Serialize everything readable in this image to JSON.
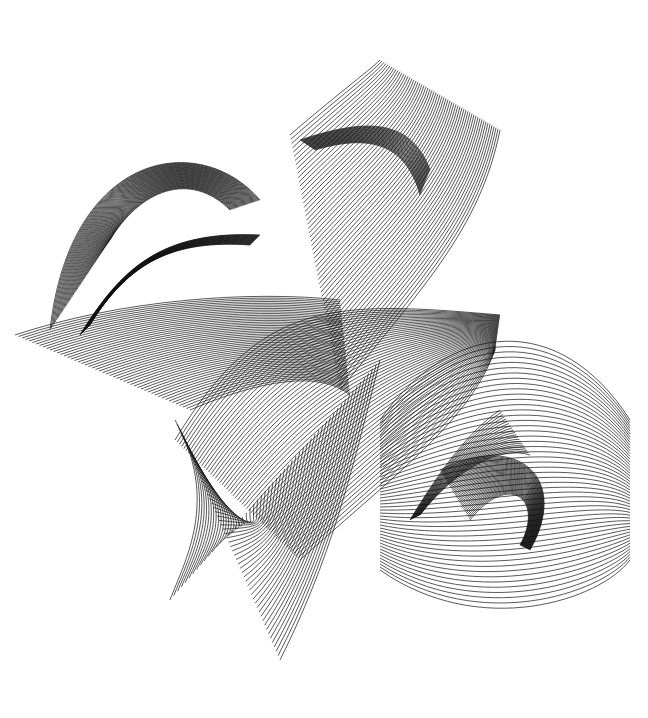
{
  "artwork": {
    "title": "",
    "background": "#ffffff",
    "ink": "#111111",
    "description": "Abstract line-art composition of twisting ribbon surfaces made of dense parallel black strokes",
    "ribbons": [
      {
        "id": "left-swirl",
        "a": [
          [
            50,
            330
          ],
          [
            70,
            150
          ],
          [
            200,
            130
          ],
          [
            260,
            200
          ]
        ],
        "b": [
          [
            110,
            240
          ],
          [
            140,
            190
          ],
          [
            190,
            170
          ],
          [
            230,
            210
          ]
        ],
        "n": 44
      },
      {
        "id": "left-flat-sheet",
        "a": [
          [
            15,
            335
          ],
          [
            120,
            300
          ],
          [
            250,
            290
          ],
          [
            340,
            300
          ]
        ],
        "b": [
          [
            190,
            410
          ],
          [
            260,
            380
          ],
          [
            320,
            370
          ],
          [
            350,
            395
          ]
        ],
        "n": 50
      },
      {
        "id": "left-dark-fin",
        "a": [
          [
            80,
            335
          ],
          [
            120,
            270
          ],
          [
            160,
            230
          ],
          [
            260,
            235
          ]
        ],
        "b": [
          [
            90,
            325
          ],
          [
            130,
            260
          ],
          [
            175,
            240
          ],
          [
            250,
            245
          ]
        ],
        "n": 24
      },
      {
        "id": "top-square",
        "a": [
          [
            290,
            135
          ],
          [
            330,
            100
          ],
          [
            370,
            70
          ],
          [
            380,
            60
          ]
        ],
        "b": [
          [
            340,
            390
          ],
          [
            420,
            290
          ],
          [
            480,
            230
          ],
          [
            500,
            130
          ]
        ],
        "n": 60
      },
      {
        "id": "top-fin",
        "a": [
          [
            300,
            140
          ],
          [
            360,
            120
          ],
          [
            410,
            115
          ],
          [
            430,
            170
          ]
        ],
        "b": [
          [
            315,
            150
          ],
          [
            365,
            135
          ],
          [
            405,
            140
          ],
          [
            420,
            195
          ]
        ],
        "n": 24
      },
      {
        "id": "center-diamond",
        "a": [
          [
            175,
            440
          ],
          [
            260,
            300
          ],
          [
            330,
            300
          ],
          [
            500,
            315
          ]
        ],
        "b": [
          [
            300,
            560
          ],
          [
            400,
            470
          ],
          [
            470,
            420
          ],
          [
            495,
            350
          ]
        ],
        "n": 56
      },
      {
        "id": "bottom-leg",
        "a": [
          [
            175,
            420
          ],
          [
            220,
            500
          ],
          [
            185,
            560
          ],
          [
            170,
            600
          ]
        ],
        "b": [
          [
            280,
            660
          ],
          [
            330,
            560
          ],
          [
            350,
            480
          ],
          [
            380,
            360
          ]
        ],
        "n": 55
      },
      {
        "id": "right-swirl",
        "a": [
          [
            380,
            420
          ],
          [
            450,
            320
          ],
          [
            560,
            310
          ],
          [
            630,
            420
          ]
        ],
        "b": [
          [
            380,
            570
          ],
          [
            480,
            640
          ],
          [
            600,
            600
          ],
          [
            630,
            560
          ]
        ],
        "n": 50
      },
      {
        "id": "right-dark-fin",
        "a": [
          [
            410,
            520
          ],
          [
            440,
            470
          ],
          [
            470,
            430
          ],
          [
            500,
            410
          ]
        ],
        "b": [
          [
            420,
            515
          ],
          [
            455,
            470
          ],
          [
            500,
            445
          ],
          [
            530,
            455
          ]
        ],
        "n": 20
      },
      {
        "id": "right-loop",
        "a": [
          [
            440,
            470
          ],
          [
            520,
            430
          ],
          [
            570,
            480
          ],
          [
            530,
            550
          ]
        ],
        "b": [
          [
            470,
            520
          ],
          [
            510,
            470
          ],
          [
            545,
            500
          ],
          [
            520,
            545
          ]
        ],
        "n": 36
      }
    ]
  }
}
